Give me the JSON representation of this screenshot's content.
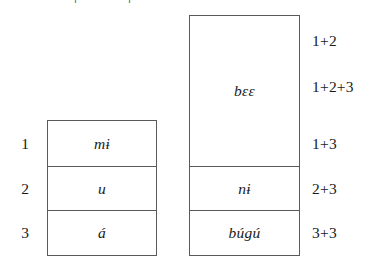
{
  "figure": {
    "clipped_above": {
      "fragment_left": "|",
      "fragment_right": "|"
    },
    "left_box": {
      "name": "singular-paradigm-box",
      "row_labels": [
        "1",
        "2",
        "3"
      ],
      "cells": [
        {
          "label": "mɨ",
          "row_label": "1"
        },
        {
          "label": "u",
          "row_label": "2"
        },
        {
          "label": "á",
          "row_label": "3"
        }
      ]
    },
    "right_box": {
      "name": "plural-paradigm-box",
      "cells": [
        {
          "label": "bɛɛ"
        },
        {
          "label": "nɨ"
        },
        {
          "label": "búgú"
        }
      ]
    },
    "right_labels": [
      "1+2",
      "1+2+3",
      "1+3",
      "2+3",
      "3+3"
    ]
  },
  "colors": {
    "border": "#5a5a5a",
    "text": "#1a1a1a",
    "background": "#ffffff"
  }
}
